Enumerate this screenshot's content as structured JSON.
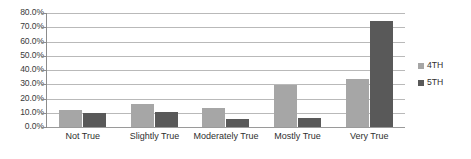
{
  "chart_data": {
    "type": "bar",
    "title": "",
    "subtitle": "",
    "xlabel": "",
    "ylabel": "",
    "categories": [
      "Not True",
      "Slightly True",
      "Moderately True",
      "Mostly True",
      "Very True"
    ],
    "series": [
      {
        "name": "4TH",
        "color": "#A6A6A6",
        "values": [
          12.0,
          16.5,
          13.0,
          29.5,
          33.5
        ]
      },
      {
        "name": "5TH",
        "color": "#595959",
        "values": [
          9.5,
          10.5,
          5.5,
          6.0,
          74.5
        ]
      }
    ],
    "ylim": [
      0,
      80
    ],
    "ytick_labels": [
      "0.0%",
      "10.0%",
      "20.0%",
      "30.0%",
      "40.0%",
      "50.0%",
      "60.0%",
      "70.0%",
      "80.0%"
    ],
    "ytick_values": [
      0,
      10,
      20,
      30,
      40,
      50,
      60,
      70,
      80
    ],
    "grid": true,
    "legend_position": "right",
    "legend_entries": [
      "4TH",
      "5TH"
    ],
    "annotations": []
  },
  "colors": {
    "series_4th": "#A6A6A6",
    "series_5th": "#595959",
    "gridline": "#B9B9B9",
    "axis": "#8C8C8C",
    "background": "#FFFFFF",
    "text": "#2F2F2F"
  }
}
